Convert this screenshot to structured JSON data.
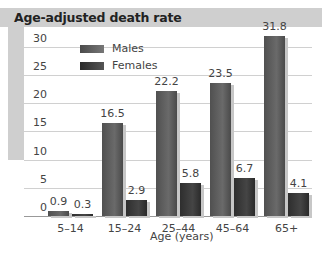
{
  "chart_data": {
    "type": "bar",
    "title": "Age-adjusted death rate",
    "xlabel": "Age (years)",
    "ylabel": "",
    "categories": [
      "5–14",
      "15–24",
      "25–44",
      "45–64",
      "65+"
    ],
    "series": [
      {
        "name": "Males",
        "values": [
          0.9,
          16.5,
          22.2,
          23.5,
          31.8
        ],
        "labels": [
          "0.9",
          "16.5",
          "22.2",
          "23.5",
          "31.8"
        ]
      },
      {
        "name": "Females",
        "values": [
          0.3,
          2.9,
          5.8,
          6.7,
          4.1
        ],
        "labels": [
          "0.3",
          "2.9",
          "5.8",
          "6.7",
          "4.1"
        ]
      }
    ],
    "yticks": [
      "0",
      "5",
      "10",
      "15",
      "20",
      "25",
      "30"
    ],
    "ylim": [
      0,
      32
    ],
    "grid": true,
    "legend_position": "top-left inside plot",
    "colors": {
      "Males": "#5a5a5a",
      "Females": "#383838",
      "frame": "#cfcfcf"
    }
  }
}
